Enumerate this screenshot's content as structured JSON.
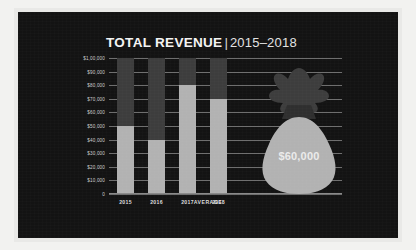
{
  "panel": {
    "background_color": "#131313",
    "frame_color": "#e9e9e7"
  },
  "title": {
    "main": "TOTAL REVENUE",
    "separator": "|",
    "subtitle": "2015–2018"
  },
  "average": {
    "icon": "money-bag-icon",
    "value_label": "$60,000",
    "category_label": "AVERAGE",
    "value": 60000,
    "bag_body_color": "#b2b2b2",
    "bag_neck_color": "#3d3d3d"
  },
  "colors": {
    "bar_filled": "#b2b2b2",
    "bar_track": "#3d3d3d",
    "gridline": "#6e6e6e",
    "text": "#dcdcdc",
    "title": "#f4f4f4"
  },
  "chart_data": {
    "type": "bar",
    "xlabel": "",
    "ylabel": "",
    "categories": [
      "2015",
      "2016",
      "2017",
      "2018"
    ],
    "values": [
      50000,
      40000,
      80000,
      70000
    ],
    "series": [
      {
        "name": "Total Revenue",
        "values": [
          50000,
          40000,
          80000,
          70000
        ]
      }
    ],
    "ylim": [
      0,
      100000
    ],
    "ytick_values": [
      0,
      10000,
      20000,
      30000,
      40000,
      50000,
      60000,
      70000,
      80000,
      90000,
      100000
    ],
    "ytick_labels": [
      "0",
      "$10,000",
      "$20,000",
      "$30,000",
      "$40,000",
      "$50,000",
      "$60,000",
      "$70,000",
      "$80,000",
      "$90,000",
      "$1,00,000"
    ],
    "grid": true,
    "legend": "none",
    "annotations": [
      {
        "label": "AVERAGE",
        "value": 60000,
        "value_label": "$60,000",
        "style": "money-bag"
      }
    ]
  }
}
